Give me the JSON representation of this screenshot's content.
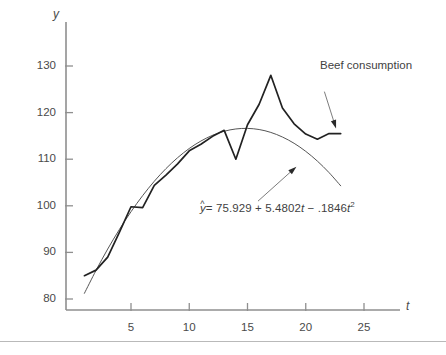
{
  "figure": {
    "background_color": "#ffffff",
    "ink_color": "#3a3a3a",
    "axis_color": "#8c8c8c"
  },
  "axes": {
    "y_title": "y",
    "x_title": "t",
    "y_ticks": [
      "80",
      "90",
      "100",
      "110",
      "120",
      "130"
    ],
    "x_ticks": [
      "5",
      "10",
      "15",
      "20",
      "25"
    ]
  },
  "annotations": {
    "series_label": "Beef consumption",
    "equation_text": "= 75.929 + 5.4802",
    "equation_yhat": "y",
    "equation_hat": "^",
    "equation_t1": "t",
    "equation_minus": " − .1846",
    "equation_t2": "t",
    "equation_exp": "2"
  },
  "chart_data": {
    "type": "line",
    "title": "",
    "subtitle": "",
    "xlabel": "t",
    "ylabel": "y",
    "xlim": [
      0,
      27
    ],
    "ylim": [
      78,
      134
    ],
    "grid": false,
    "legend_position": "annotation-callouts",
    "y_ticks": [
      80,
      90,
      100,
      110,
      120,
      130
    ],
    "x_ticks": [
      5,
      10,
      15,
      20,
      25
    ],
    "annotations": [
      {
        "text": "Beef consumption",
        "target_series": "Beef consumption",
        "arrow_from_x": 21.6,
        "arrow_from_y": 124.5,
        "arrow_to_x": 22.6,
        "arrow_to_y": 116.6
      },
      {
        "text": "ŷ = 75.929 + 5.4802t − .1846t²",
        "target_series": "Fitted quadratic trend",
        "arrow_from_x": 15.9,
        "arrow_from_y": 101.0,
        "arrow_to_x": 19.2,
        "arrow_to_y": 108.4
      }
    ],
    "series": [
      {
        "name": "Beef consumption",
        "style": "observed-polyline",
        "line_width": 1.7,
        "color": "#222222",
        "x": [
          1,
          2,
          3,
          4,
          5,
          6,
          7,
          8,
          9,
          10,
          11,
          12,
          13,
          14,
          15,
          16,
          17,
          18,
          19,
          20,
          21,
          22,
          23
        ],
        "values": [
          85.0,
          86.2,
          89.0,
          94.3,
          99.8,
          99.6,
          104.4,
          106.6,
          109.0,
          111.8,
          113.2,
          114.9,
          116.2,
          110.0,
          117.4,
          121.8,
          128.0,
          121.0,
          117.6,
          115.4,
          114.3,
          115.5,
          115.5
        ]
      },
      {
        "name": "Fitted quadratic trend",
        "style": "smooth-curve",
        "equation": "yhat = 75.929 + 5.4802*t - 0.1846*t^2",
        "line_width": 1.0,
        "color": "#555555",
        "intercept": 75.929,
        "slope_linear": 5.4802,
        "slope_quadratic": -0.1846,
        "x": [
          1,
          2,
          3,
          4,
          5,
          6,
          7,
          8,
          9,
          10,
          11,
          12,
          13,
          14,
          15,
          16,
          17,
          18,
          19,
          20,
          21,
          22,
          23
        ],
        "values": [
          81.22,
          86.15,
          90.72,
          94.91,
          98.73,
          102.18,
          105.27,
          107.98,
          110.32,
          112.3,
          113.9,
          115.13,
          116.0,
          116.49,
          116.61,
          116.37,
          115.75,
          114.76,
          113.41,
          111.68,
          109.59,
          107.12,
          104.29
        ]
      }
    ]
  },
  "page": {
    "rule_present": true
  }
}
